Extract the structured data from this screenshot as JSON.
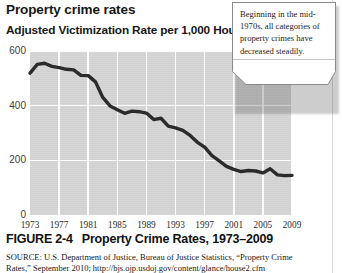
{
  "headline": "Property crime rates",
  "subhead": "Adjusted Victimization Rate per 1,000 Households",
  "callout": {
    "text": "Beginning in the mid-1970s, all categories of property crimes have decreased steadily."
  },
  "caption": {
    "figure_number": "FIGURE 2-4",
    "title": "Property Crime Rates, 1973–2009"
  },
  "source": {
    "line1": "SOURCE: U.S. Department of Justice, Bureau of Justice Statistics, “Property Crime",
    "line2": "Rates,” September 2010; http://bjs.ojp.usdoj.gov/content/glance/house2.cfm"
  },
  "chart_data": {
    "type": "line",
    "title": "Property Crime Rates, 1973–2009",
    "xlabel": "",
    "ylabel": "Adjusted Victimization Rate per 1,000 Households",
    "xlim": [
      1973,
      2009
    ],
    "ylim": [
      0,
      600
    ],
    "yticks": [
      0,
      200,
      400,
      600
    ],
    "ytick_labels": [
      "0",
      "200",
      "400",
      "600"
    ],
    "xticks": [
      1973,
      1977,
      1981,
      1985,
      1989,
      1993,
      1997,
      2001,
      2005,
      2009
    ],
    "xtick_labels": [
      "1973",
      "1977",
      "1981",
      "1985",
      "1989",
      "1993",
      "1997",
      "2001",
      "2005",
      "2009"
    ],
    "grid": true,
    "legend": false,
    "line_color": "#2b2b2b",
    "plot_background": "#d3d3d3",
    "series": [
      {
        "name": "Property crime rate",
        "x": [
          1973,
          1974,
          1975,
          1976,
          1977,
          1978,
          1979,
          1980,
          1981,
          1982,
          1983,
          1984,
          1985,
          1986,
          1987,
          1988,
          1989,
          1990,
          1991,
          1992,
          1993,
          1994,
          1995,
          1996,
          1997,
          1998,
          1999,
          2000,
          2001,
          2002,
          2003,
          2004,
          2005,
          2006,
          2007,
          2008,
          2009
        ],
        "values": [
          519,
          551,
          555,
          544,
          539,
          533,
          531,
          511,
          510,
          487,
          430,
          399,
          385,
          372,
          380,
          378,
          373,
          349,
          354,
          325,
          319,
          310,
          291,
          266,
          248,
          217,
          198,
          178,
          167,
          159,
          163,
          161,
          154,
          169,
          147,
          144,
          145
        ]
      }
    ]
  }
}
